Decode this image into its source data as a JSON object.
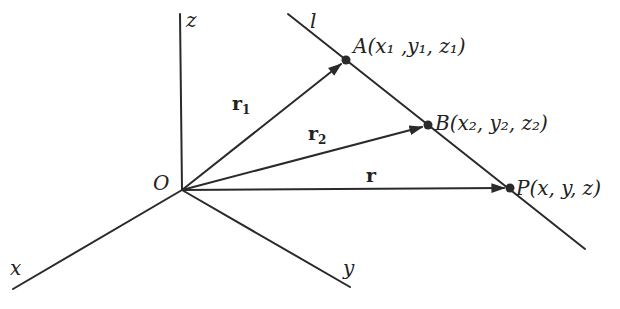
{
  "figure": {
    "origin": {
      "label": "O",
      "x": 182,
      "y": 190
    },
    "axes": [
      {
        "name": "z",
        "label": "z",
        "end": [
          180,
          14
        ],
        "label_pos": [
          187,
          26
        ]
      },
      {
        "name": "x",
        "label": "x",
        "end": [
          13,
          289
        ],
        "label_pos": [
          11,
          276
        ]
      },
      {
        "name": "y",
        "label": "y",
        "end": [
          350,
          287
        ],
        "label_pos": [
          343,
          275
        ]
      }
    ],
    "line_l": {
      "label": "l",
      "start": [
        288,
        14
      ],
      "end": [
        585,
        249
      ],
      "label_pos": [
        311,
        28
      ]
    },
    "points": [
      {
        "id": "A",
        "name": "A",
        "coords": [
          "x",
          "1",
          "y",
          "1",
          "z",
          "1"
        ],
        "text": "A(x₁ ,y₁, z₁)",
        "x": 346,
        "y": 60
      },
      {
        "id": "B",
        "name": "B",
        "coords": [
          "x",
          "2",
          "y",
          "2",
          "z",
          "2"
        ],
        "text": "B(x₂, y₂, z₂)",
        "x": 428,
        "y": 125
      },
      {
        "id": "P",
        "name": "P",
        "coords": [
          "x",
          "",
          "y",
          "",
          "z",
          ""
        ],
        "text": "P(x, y, z)",
        "x": 510,
        "y": 188
      }
    ],
    "vectors": [
      {
        "name": "r1",
        "label": "r",
        "sub": "1",
        "to": "A",
        "label_pos": [
          233,
          110
        ]
      },
      {
        "name": "r2",
        "label": "r",
        "sub": "2",
        "to": "B",
        "label_pos": [
          309,
          141
        ]
      },
      {
        "name": "r",
        "label": "r",
        "sub": "",
        "to": "P",
        "label_pos": [
          366,
          182
        ]
      }
    ],
    "colors": {
      "ink": "#2a2a2a",
      "background": "#ffffff"
    }
  },
  "labels": {
    "O": "O",
    "z": "z",
    "x": "x",
    "y": "y",
    "l": "l",
    "A": "A",
    "A_coords": "(x₁ ,y₁, z₁)",
    "B": "B",
    "B_coords": "(x₂, y₂, z₂)",
    "P": "P",
    "P_coords": "(x, y, z)",
    "r1": "r",
    "r1_sub": "1",
    "r2": "r",
    "r2_sub": "2",
    "r": "r"
  }
}
